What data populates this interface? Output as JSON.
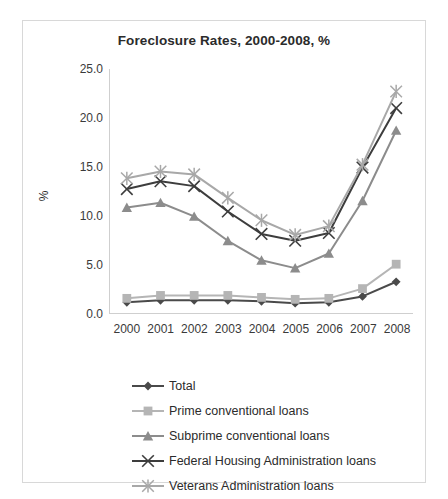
{
  "chart_data": {
    "type": "line",
    "title": "Foreclosure Rates, 2000-2008, %",
    "xlabel": "",
    "ylabel": "%",
    "categories": [
      "2000",
      "2001",
      "2002",
      "2003",
      "2004",
      "2005",
      "2006",
      "2007",
      "2008"
    ],
    "ylim": [
      0.0,
      25.0
    ],
    "ytick_labels": [
      "0.0",
      "5.0",
      "10.0",
      "15.0",
      "20.0",
      "25.0"
    ],
    "ytick_values": [
      0.0,
      5.0,
      10.0,
      15.0,
      20.0,
      25.0
    ],
    "grid": false,
    "legend_position": "below",
    "series": [
      {
        "name": "Total",
        "color": "#4a4a4a",
        "marker": "diamond",
        "values": [
          1.1,
          1.3,
          1.3,
          1.3,
          1.2,
          1.0,
          1.1,
          1.7,
          3.2
        ]
      },
      {
        "name": "Prime conventional loans",
        "color": "#b5b5b5",
        "marker": "square",
        "values": [
          1.5,
          1.8,
          1.8,
          1.8,
          1.6,
          1.4,
          1.5,
          2.5,
          5.0
        ]
      },
      {
        "name": "Subprime conventional loans",
        "color": "#8c8c8c",
        "marker": "triangle",
        "values": [
          10.8,
          11.3,
          9.9,
          7.4,
          5.4,
          4.6,
          6.1,
          11.5,
          18.7
        ]
      },
      {
        "name": "Federal Housing Administration loans",
        "color": "#3d3d3d",
        "marker": "cross",
        "values": [
          12.7,
          13.5,
          13.0,
          10.4,
          8.1,
          7.4,
          8.2,
          14.9,
          21.0
        ]
      },
      {
        "name": "Veterans Administration loans",
        "color": "#a8a8a8",
        "marker": "star",
        "values": [
          13.8,
          14.5,
          14.2,
          11.8,
          9.5,
          8.0,
          8.9,
          15.2,
          22.7
        ]
      }
    ]
  },
  "figure": {
    "top_ghost_text": ""
  }
}
